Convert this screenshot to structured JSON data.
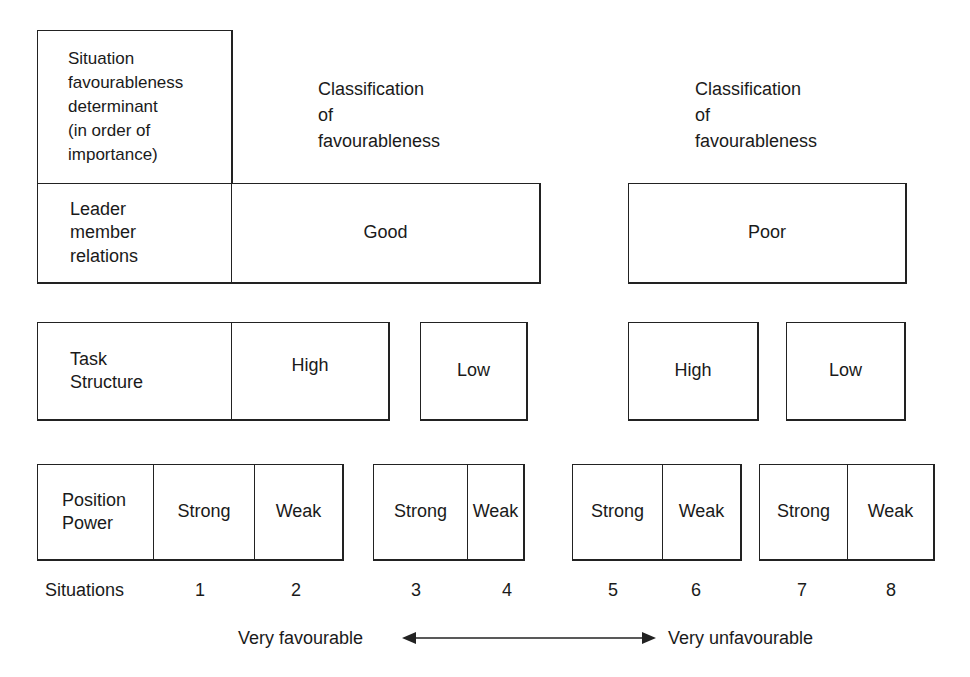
{
  "diagram": {
    "header": {
      "determinant_title": "Situation\nfavourableness\ndeterminant\n(in order of\nimportance)",
      "classification_left": "Classification\nof\nfavourableness",
      "classification_right": "Classification\nof\nfavourableness"
    },
    "rows": {
      "leader_member_relations": {
        "label": "Leader\nmember\nrelations",
        "values": [
          "Good",
          "Poor"
        ]
      },
      "task_structure": {
        "label": "Task\nStructure",
        "values": [
          "High",
          "Low",
          "High",
          "Low"
        ]
      },
      "position_power": {
        "label": "Position\nPower",
        "values": [
          "Strong",
          "Weak",
          "Strong",
          "Weak",
          "Strong",
          "Weak",
          "Strong",
          "Weak"
        ]
      }
    },
    "situations": {
      "label": "Situations",
      "numbers": [
        "1",
        "2",
        "3",
        "4",
        "5",
        "6",
        "7",
        "8"
      ]
    },
    "scale": {
      "left_label": "Very favourable",
      "right_label": "Very unfavourable"
    }
  }
}
